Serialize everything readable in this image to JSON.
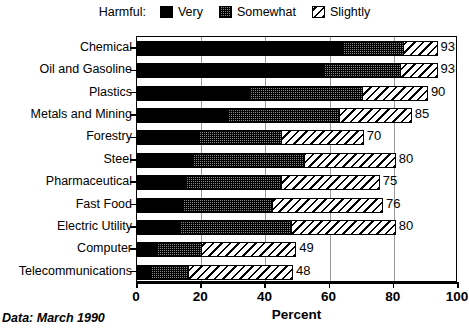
{
  "legend": {
    "title": "Harmful:",
    "entries": [
      {
        "label": "Very",
        "key": "very",
        "swatch": "solid-black-swatch"
      },
      {
        "label": "Somewhat",
        "key": "somewhat",
        "swatch": "gray-stipple-swatch"
      },
      {
        "label": "Slightly",
        "key": "slightly",
        "swatch": "diagonal-hatch-swatch"
      }
    ]
  },
  "axis": {
    "xlabel": "Percent",
    "xticks": [
      0,
      20,
      40,
      60,
      80,
      100
    ],
    "xtick_labels": [
      "0",
      "20",
      "40",
      "60",
      "80",
      "100"
    ]
  },
  "footer": {
    "note": "Data:  March 1990"
  },
  "chart_data": {
    "type": "bar",
    "orientation": "horizontal",
    "stacked": true,
    "title": "",
    "subtitle": "",
    "xlabel": "Percent",
    "ylabel": "",
    "xlim": [
      0,
      100
    ],
    "grid": true,
    "grid_axis": "x",
    "legend_position": "top-center",
    "legend_title": "Harmful:",
    "categories": [
      "Chemical",
      "Oil and Gasoline",
      "Plastics",
      "Metals and Mining",
      "Forestry",
      "Steel",
      "Pharmaceutical",
      "Fast Food",
      "Electric Utility",
      "Computer",
      "Telecommunications"
    ],
    "series": [
      {
        "name": "Very",
        "values": [
          64,
          58,
          35,
          28,
          19,
          17,
          15,
          14,
          13,
          6,
          4
        ]
      },
      {
        "name": "Somewhat",
        "values": [
          19,
          24,
          35,
          35,
          26,
          35,
          30,
          28,
          35,
          14,
          12
        ]
      },
      {
        "name": "Slightly",
        "values": [
          10,
          11,
          20,
          22,
          25,
          28,
          30,
          34,
          32,
          29,
          32
        ]
      }
    ],
    "totals": [
      93,
      93,
      90,
      85,
      70,
      80,
      75,
      76,
      80,
      49,
      48
    ],
    "total_labels": [
      "93",
      "93",
      "90",
      "85",
      "70",
      "80",
      "75",
      "76",
      "80",
      "49",
      "48"
    ],
    "annotations": [
      "Data:  March 1990"
    ]
  },
  "colors": {
    "very": "#000000",
    "somewhat": "#8a8a8a",
    "slightly": "#ffffff",
    "frame": "#000000",
    "gridline": "#9a9a9a"
  }
}
